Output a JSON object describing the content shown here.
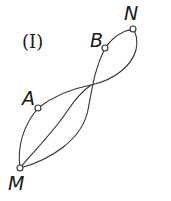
{
  "figure": {
    "label": "(I)",
    "stroke_color": "#333333",
    "background": "#ffffff"
  },
  "nodes": [
    {
      "id": "N",
      "label": "N",
      "x": 133,
      "y": 29
    },
    {
      "id": "B",
      "label": "B",
      "x": 105,
      "y": 48
    },
    {
      "id": "A",
      "label": "A",
      "x": 38,
      "y": 108
    },
    {
      "id": "M",
      "label": "M",
      "x": 20,
      "y": 168
    }
  ],
  "edges": [
    {
      "from": "B",
      "to": "N"
    },
    {
      "from": "A",
      "to": "N"
    },
    {
      "from": "M",
      "to": "A"
    },
    {
      "from": "M",
      "to": "B"
    },
    {
      "from": "M",
      "to": "N"
    }
  ]
}
